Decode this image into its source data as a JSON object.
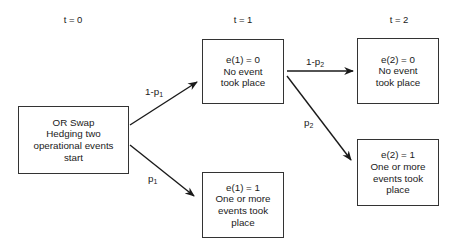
{
  "time_labels": {
    "t0": "t = 0",
    "t1": "t = 1",
    "t2": "t = 2"
  },
  "nodes": {
    "start": {
      "lines": [
        "OR Swap",
        "Hedging two",
        "operational events",
        "start"
      ]
    },
    "e1_0": {
      "lines": [
        "e(1) = 0",
        "No event",
        "took place"
      ]
    },
    "e1_1": {
      "lines": [
        "e(1) = 1",
        "One or more",
        "events took",
        "place"
      ]
    },
    "e2_0": {
      "lines": [
        "e(2) = 0",
        "No event",
        "took place"
      ]
    },
    "e2_1": {
      "lines": [
        "e(2) = 1",
        "One or more",
        "events took",
        "place"
      ]
    }
  },
  "edges": {
    "start_to_e1_0": {
      "base": "1-p",
      "sub": "1"
    },
    "start_to_e1_1": {
      "base": "p",
      "sub": "1"
    },
    "e1_0_to_e2_0": {
      "base": "1-p",
      "sub": "2"
    },
    "e1_0_to_e2_1": {
      "base": "p",
      "sub": "2"
    }
  },
  "colors": {
    "line": "#1a1a1a",
    "box_border": "#333333",
    "background": "#ffffff"
  }
}
